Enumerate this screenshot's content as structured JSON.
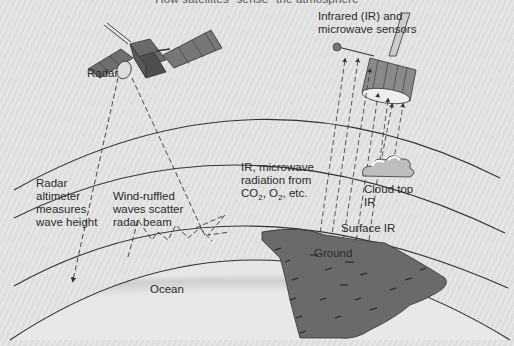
{
  "diagram": {
    "title": "How satellites \"sense\" the atmosphere",
    "labels": {
      "radar": "Radar",
      "sensors": "Infrared (IR) and\nmicrowave sensors",
      "altimeter": "Radar\naltimeter\nmeasures\nwave height",
      "wind_ruffled": "Wind-ruffled\nwaves scatter\nradar beam",
      "ir_microwave_line1": "IR, microwave",
      "ir_microwave_line2": "radiation from",
      "ir_microwave_co2": "CO",
      "ir_microwave_sub2a": "2",
      "ir_microwave_o2": ", O",
      "ir_microwave_sub2b": "2",
      "ir_microwave_etc": ", etc.",
      "cloud_top": "Cloud top\nIR",
      "surface_ir": "Surface IR",
      "ground": "Ground",
      "ocean": "Ocean"
    },
    "icons": [
      "radar-satellite-icon",
      "ir-microwave-satellite-icon",
      "cloud-icon",
      "landmass-icon"
    ],
    "colors": {
      "background": "#e2e2e2",
      "line": "#333333",
      "land": "#6a6a6a",
      "satellite_dark": "#555555",
      "satellite_light": "#9a9a9a"
    }
  }
}
